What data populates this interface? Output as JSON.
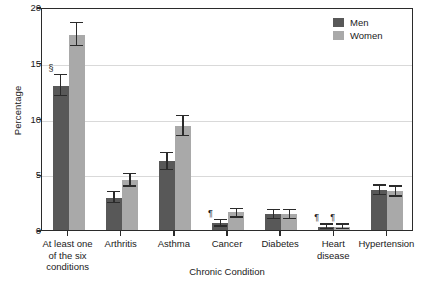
{
  "chart_data": {
    "type": "bar",
    "title": "",
    "xlabel": "Chronic Condition",
    "ylabel": "Percentage",
    "ylim": [
      0,
      20
    ],
    "yticks": [
      0,
      5,
      10,
      15,
      20
    ],
    "ytick_labels": [
      "0",
      "5",
      "10",
      "15",
      "20"
    ],
    "grid": true,
    "legend_position": "top-right",
    "categories": [
      "At least one\nof the six\nconditions",
      "Arthritis",
      "Asthma",
      "Cancer",
      "Diabetes",
      "Heart\ndisease",
      "Hypertension"
    ],
    "series": [
      {
        "name": "Men",
        "color": "#585858",
        "values": [
          12.9,
          2.9,
          6.2,
          0.6,
          1.4,
          0.3,
          3.6
        ],
        "err_low": [
          12.0,
          2.4,
          5.4,
          0.3,
          1.0,
          0.1,
          3.1
        ],
        "err_high": [
          14.0,
          3.5,
          7.0,
          1.0,
          1.9,
          0.6,
          4.1
        ],
        "markers": [
          "§",
          "",
          "",
          "¶",
          "",
          "¶",
          ""
        ]
      },
      {
        "name": "Women",
        "color": "#a9a9a9",
        "values": [
          17.5,
          4.5,
          9.3,
          1.6,
          1.4,
          0.3,
          3.5
        ],
        "err_low": [
          16.5,
          3.9,
          8.4,
          1.1,
          1.0,
          0.1,
          3.0
        ],
        "err_high": [
          18.7,
          5.1,
          10.3,
          2.0,
          1.9,
          0.6,
          4.0
        ],
        "markers": [
          "",
          "",
          "",
          "",
          "",
          "¶",
          ""
        ]
      }
    ]
  },
  "legend": {
    "items": [
      {
        "label": "Men"
      },
      {
        "label": "Women"
      }
    ]
  },
  "axes": {
    "y_title": "Percentage",
    "x_title": "Chronic Condition"
  }
}
